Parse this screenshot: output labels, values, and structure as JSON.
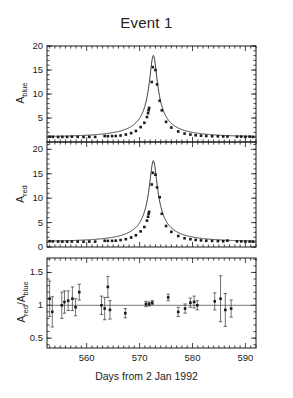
{
  "figure": {
    "title": "Event 1",
    "xlabel": "Days from 2 Jan 1992"
  },
  "panels": {
    "blue": {
      "ylabel_main": "A",
      "ylabel_sub": "blue",
      "yticks": [
        "20",
        "15",
        "10",
        "5"
      ]
    },
    "red": {
      "ylabel_main": "A",
      "ylabel_sub": "red",
      "yticks": [
        "20",
        "15",
        "10",
        "5",
        "0"
      ]
    },
    "ratio": {
      "ylabel_num_main": "A",
      "ylabel_num_sub": "red",
      "ylabel_den_main": "A",
      "ylabel_den_sub": "blue",
      "ylabel_slash": "/",
      "yticks": [
        "1.5",
        "1",
        "0.5"
      ]
    }
  },
  "xaxis": {
    "ticklabels": [
      "560",
      "570",
      "580",
      "590"
    ],
    "tickvalues": [
      560,
      570,
      580,
      590
    ],
    "range": [
      552.5,
      592.0
    ],
    "minor_step": 1,
    "major_step": 10
  },
  "chart_data": {
    "type": "line",
    "title": "Event 1",
    "xlabel": "Days from 2 Jan 1992",
    "xlim": [
      552.5,
      592.0
    ],
    "grid": false,
    "legend": null,
    "subplots": [
      {
        "name": "A_blue",
        "type": "scatter+line",
        "ylabel": "A_blue",
        "ylim": [
          0,
          20
        ],
        "yticks": [
          5,
          10,
          15,
          20
        ],
        "model": {
          "description": "point-lens microlensing magnification curve",
          "t0": 572.6,
          "A_max": 18.0,
          "baseline": 1.05
        },
        "points": [
          {
            "x": 553.0,
            "y": 1.1
          },
          {
            "x": 553.6,
            "y": 1.08
          },
          {
            "x": 554.6,
            "y": 1.05
          },
          {
            "x": 555.4,
            "y": 1.06
          },
          {
            "x": 556.3,
            "y": 1.05
          },
          {
            "x": 557.2,
            "y": 1.1
          },
          {
            "x": 558.3,
            "y": 1.07
          },
          {
            "x": 559.4,
            "y": 1.05
          },
          {
            "x": 560.5,
            "y": 1.08
          },
          {
            "x": 561.6,
            "y": 1.06
          },
          {
            "x": 563.4,
            "y": 1.25
          },
          {
            "x": 564.0,
            "y": 1.2
          },
          {
            "x": 564.8,
            "y": 1.22
          },
          {
            "x": 565.5,
            "y": 1.25
          },
          {
            "x": 566.4,
            "y": 1.35
          },
          {
            "x": 567.4,
            "y": 1.55
          },
          {
            "x": 568.4,
            "y": 1.85
          },
          {
            "x": 569.3,
            "y": 2.3
          },
          {
            "x": 570.2,
            "y": 3.1
          },
          {
            "x": 570.9,
            "y": 4.0
          },
          {
            "x": 571.4,
            "y": 5.2
          },
          {
            "x": 571.6,
            "y": 6.0
          },
          {
            "x": 571.7,
            "y": 6.6
          },
          {
            "x": 571.8,
            "y": 7.1
          },
          {
            "x": 572.3,
            "y": 12.5
          },
          {
            "x": 572.5,
            "y": 15.6
          },
          {
            "x": 573.0,
            "y": 15.0
          },
          {
            "x": 573.3,
            "y": 12.0
          },
          {
            "x": 573.8,
            "y": 8.6
          },
          {
            "x": 574.2,
            "y": 6.6
          },
          {
            "x": 575.0,
            "y": 4.2
          },
          {
            "x": 576.0,
            "y": 3.0
          },
          {
            "x": 577.3,
            "y": 2.2
          },
          {
            "x": 578.5,
            "y": 1.75
          },
          {
            "x": 579.6,
            "y": 1.55
          },
          {
            "x": 580.6,
            "y": 1.4
          },
          {
            "x": 581.6,
            "y": 1.32
          },
          {
            "x": 582.6,
            "y": 1.25
          },
          {
            "x": 583.7,
            "y": 1.2
          },
          {
            "x": 584.8,
            "y": 1.18
          },
          {
            "x": 585.8,
            "y": 1.15
          },
          {
            "x": 586.6,
            "y": 1.14
          },
          {
            "x": 588.4,
            "y": 1.1
          },
          {
            "x": 589.2,
            "y": 1.12
          },
          {
            "x": 590.0,
            "y": 1.08
          },
          {
            "x": 590.8,
            "y": 1.1
          },
          {
            "x": 591.4,
            "y": 1.06
          }
        ]
      },
      {
        "name": "A_red",
        "type": "scatter+line",
        "ylabel": "A_red",
        "ylim": [
          0,
          21.5
        ],
        "yticks": [
          0,
          5,
          10,
          15,
          20
        ],
        "model": {
          "description": "point-lens microlensing magnification curve",
          "t0": 572.6,
          "A_max": 17.6,
          "baseline": 1.1
        },
        "points": [
          {
            "x": 553.0,
            "y": 1.2
          },
          {
            "x": 553.6,
            "y": 1.15
          },
          {
            "x": 554.6,
            "y": 1.12
          },
          {
            "x": 555.4,
            "y": 1.1
          },
          {
            "x": 556.3,
            "y": 1.1
          },
          {
            "x": 557.2,
            "y": 1.12
          },
          {
            "x": 558.3,
            "y": 1.1
          },
          {
            "x": 559.4,
            "y": 1.08
          },
          {
            "x": 560.5,
            "y": 1.12
          },
          {
            "x": 561.6,
            "y": 1.1
          },
          {
            "x": 563.4,
            "y": 1.28
          },
          {
            "x": 564.0,
            "y": 1.25
          },
          {
            "x": 564.8,
            "y": 1.26
          },
          {
            "x": 565.5,
            "y": 1.3
          },
          {
            "x": 566.4,
            "y": 1.42
          },
          {
            "x": 567.4,
            "y": 1.6
          },
          {
            "x": 568.4,
            "y": 1.95
          },
          {
            "x": 569.3,
            "y": 2.4
          },
          {
            "x": 570.2,
            "y": 3.2
          },
          {
            "x": 570.9,
            "y": 4.1
          },
          {
            "x": 571.4,
            "y": 5.4
          },
          {
            "x": 571.6,
            "y": 6.2
          },
          {
            "x": 571.7,
            "y": 6.8
          },
          {
            "x": 571.8,
            "y": 7.2
          },
          {
            "x": 572.3,
            "y": 12.8
          },
          {
            "x": 572.5,
            "y": 15.2
          },
          {
            "x": 573.0,
            "y": 14.8
          },
          {
            "x": 573.3,
            "y": 12.2
          },
          {
            "x": 573.8,
            "y": 10.2
          },
          {
            "x": 574.2,
            "y": 6.8
          },
          {
            "x": 575.0,
            "y": 4.3
          },
          {
            "x": 576.0,
            "y": 3.1
          },
          {
            "x": 577.3,
            "y": 2.25
          },
          {
            "x": 578.5,
            "y": 1.8
          },
          {
            "x": 579.6,
            "y": 1.6
          },
          {
            "x": 580.6,
            "y": 1.45
          },
          {
            "x": 581.6,
            "y": 1.35
          },
          {
            "x": 582.6,
            "y": 1.28
          },
          {
            "x": 583.7,
            "y": 1.25
          },
          {
            "x": 584.8,
            "y": 1.2
          },
          {
            "x": 585.8,
            "y": 1.18
          },
          {
            "x": 586.6,
            "y": 1.3
          },
          {
            "x": 588.4,
            "y": 1.15
          },
          {
            "x": 589.2,
            "y": 1.15
          },
          {
            "x": 590.0,
            "y": 1.12
          },
          {
            "x": 590.8,
            "y": 1.12
          },
          {
            "x": 591.4,
            "y": 1.1
          }
        ]
      },
      {
        "name": "A_red/A_blue",
        "type": "scatter",
        "ylabel": "A_red/A_blue",
        "ylim": [
          0.35,
          1.72
        ],
        "yticks": [
          0.5,
          1.0,
          1.5
        ],
        "reference_line": 1.0,
        "points": [
          {
            "x": 553.0,
            "y": 1.1,
            "err": 0.27
          },
          {
            "x": 553.5,
            "y": 0.9,
            "err": 0.23
          },
          {
            "x": 555.3,
            "y": 1.0,
            "err": 0.2
          },
          {
            "x": 555.8,
            "y": 1.05,
            "err": 0.17
          },
          {
            "x": 556.5,
            "y": 1.07,
            "err": 0.15
          },
          {
            "x": 557.3,
            "y": 1.1,
            "err": 0.18
          },
          {
            "x": 557.9,
            "y": 0.97,
            "err": 0.13
          },
          {
            "x": 558.6,
            "y": 1.2,
            "err": 0.12
          },
          {
            "x": 562.8,
            "y": 1.0,
            "err": 0.14
          },
          {
            "x": 563.4,
            "y": 0.95,
            "err": 0.17
          },
          {
            "x": 564.0,
            "y": 1.28,
            "err": 0.16
          },
          {
            "x": 564.4,
            "y": 0.93,
            "err": 0.14
          },
          {
            "x": 567.3,
            "y": 0.88,
            "err": 0.07
          },
          {
            "x": 571.2,
            "y": 1.02,
            "err": 0.04
          },
          {
            "x": 571.8,
            "y": 1.02,
            "err": 0.03
          },
          {
            "x": 572.4,
            "y": 1.04,
            "err": 0.03
          },
          {
            "x": 575.4,
            "y": 1.12,
            "err": 0.05
          },
          {
            "x": 577.3,
            "y": 0.9,
            "err": 0.07
          },
          {
            "x": 578.6,
            "y": 0.95,
            "err": 0.07
          },
          {
            "x": 579.6,
            "y": 1.04,
            "err": 0.07
          },
          {
            "x": 580.3,
            "y": 1.05,
            "err": 0.09
          },
          {
            "x": 580.9,
            "y": 1.0,
            "err": 0.07
          },
          {
            "x": 584.2,
            "y": 1.06,
            "err": 0.13
          },
          {
            "x": 585.3,
            "y": 1.1,
            "err": 0.35
          },
          {
            "x": 586.2,
            "y": 0.93,
            "err": 0.25
          },
          {
            "x": 587.3,
            "y": 0.95,
            "err": 0.13
          }
        ]
      }
    ]
  }
}
